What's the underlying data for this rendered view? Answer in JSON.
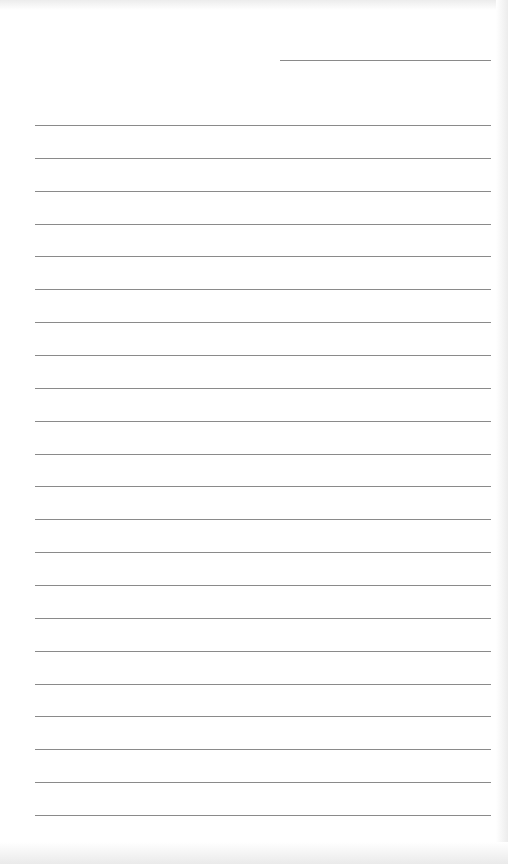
{
  "document": {
    "type": "lined-paper",
    "line_color": "#8a8a8a",
    "background_color": "#ffffff",
    "header_line": {
      "x1": 280,
      "x2": 491,
      "y": 60
    },
    "rule_lines": {
      "count": 22,
      "x1": 35,
      "x2": 491,
      "first_y": 125,
      "spacing": 32.86
    }
  }
}
